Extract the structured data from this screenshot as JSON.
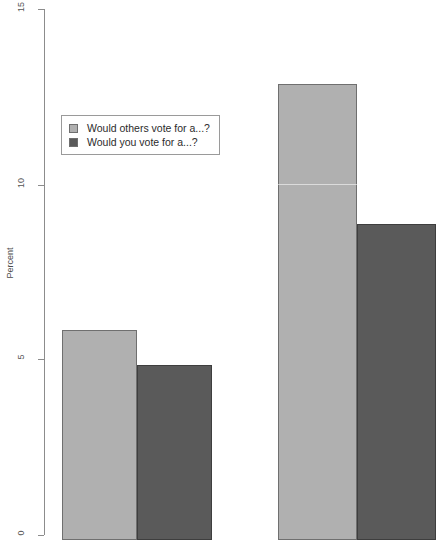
{
  "chart_data": {
    "type": "bar",
    "title": "",
    "subtitle": "",
    "xlabel": "",
    "ylabel": "Percent",
    "ylim": [
      0,
      15
    ],
    "yticks": [
      0,
      5,
      10,
      15
    ],
    "ytick_labels": [
      "0",
      "5",
      "10",
      "15"
    ],
    "grid": false,
    "legend_position": "upper left",
    "categories": [
      "group-1",
      "group-2"
    ],
    "series": [
      {
        "name": "Would others vote for a...?",
        "color": "#b0b0b0",
        "values": [
          6,
          13
        ]
      },
      {
        "name": "Would you vote for a...?",
        "color": "#5a5a5a",
        "values": [
          5,
          9
        ]
      }
    ]
  },
  "axis": {
    "y_title": "Percent",
    "ticks": [
      {
        "label": "15",
        "value": 15
      },
      {
        "label": "10",
        "value": 10
      },
      {
        "label": "5",
        "value": 5
      },
      {
        "label": "0",
        "value": 0
      }
    ]
  },
  "legend": {
    "entries": [
      {
        "label": "Would others vote for a...?",
        "swatch": "#b0b0b0"
      },
      {
        "label": "Would you vote for a...?",
        "swatch": "#5a5a5a"
      }
    ]
  },
  "colors": {
    "series_light": "#b0b0b0",
    "series_dark": "#5a5a5a",
    "bar_border_light": "#6f6f6f",
    "bar_border_dark": "#3e3e3e",
    "axis": "#8c8c8c",
    "background": "#ffffff",
    "text": "#2b2b2b"
  }
}
